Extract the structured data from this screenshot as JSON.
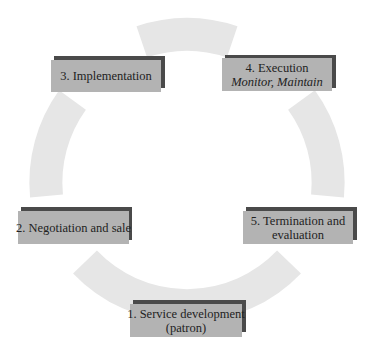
{
  "diagram": {
    "type": "cycle",
    "ring_color": "#e6e6e6",
    "box_fill": "#b3b3b3",
    "box_shadow": "#4a4a4a",
    "steps": [
      {
        "id": "1",
        "label": "1. Service development",
        "sublabel": "(patron)"
      },
      {
        "id": "2",
        "label": "2. Negotiation and sale",
        "sublabel": ""
      },
      {
        "id": "3",
        "label": "3. Implementation",
        "sublabel": ""
      },
      {
        "id": "4",
        "label": "4. Execution",
        "sublabel": "Monitor, Maintain"
      },
      {
        "id": "5",
        "label": "5. Termination and",
        "sublabel": "evaluation"
      }
    ]
  }
}
